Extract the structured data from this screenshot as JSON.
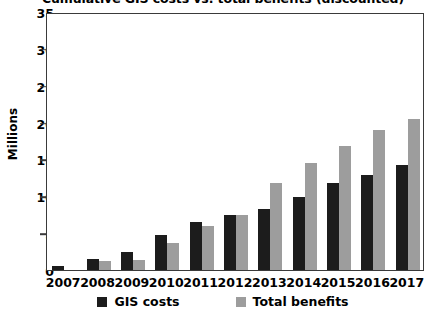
{
  "chart_data": {
    "type": "bar",
    "title": "Cumulative GIS costs vs. total benefits (discounted)",
    "xlabel": "",
    "ylabel": "Millions",
    "ylim": [
      0,
      35
    ],
    "yticks": [
      0,
      5,
      10,
      15,
      20,
      25,
      30,
      35
    ],
    "ytick_labels": [
      "0",
      "5",
      "10",
      "15",
      "20",
      "25",
      "30",
      "35"
    ],
    "grid": false,
    "legend_position": "bottom",
    "categories": [
      "2007",
      "2008",
      "2009",
      "2010",
      "2011",
      "2012",
      "2013",
      "2014",
      "2015",
      "2016",
      "2017"
    ],
    "series": [
      {
        "name": "GIS costs",
        "color": "#1c1c1c",
        "values": [
          0.6,
          1.5,
          2.4,
          4.7,
          6.5,
          7.5,
          8.3,
          9.9,
          11.8,
          12.9,
          14.3
        ]
      },
      {
        "name": "Total benefits",
        "color": "#9d9d9d",
        "values": [
          0.0,
          1.2,
          1.3,
          3.7,
          6.0,
          7.4,
          11.8,
          14.5,
          16.8,
          19.0,
          20.5
        ]
      }
    ]
  },
  "legend": {
    "items": [
      {
        "label": "GIS costs",
        "swatch": "costs"
      },
      {
        "label": "Total benefits",
        "swatch": "benefits"
      }
    ]
  }
}
